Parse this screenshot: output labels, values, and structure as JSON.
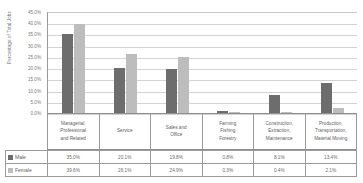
{
  "chart_data": {
    "type": "bar",
    "title": "",
    "xlabel": "",
    "ylabel": "Percentage of Total Jobs",
    "ylim": [
      0,
      45
    ],
    "grid": true,
    "legend_position": "bottom-table",
    "categories": [
      "Managerial, Professional and Related",
      "Service",
      "Sales and Office",
      "Farming Fishing Forestry",
      "Construction, Extraction, Maintenance",
      "Production, Transportation, Material Moving"
    ],
    "category_lines": [
      [
        "Managerial,",
        "Professional",
        "and Related"
      ],
      [
        "Service"
      ],
      [
        "Sales and",
        "Office"
      ],
      [
        "Farming",
        "Fishing",
        "Forestry"
      ],
      [
        "Construction,",
        "Extraction,",
        "Maintenance"
      ],
      [
        "Production,",
        "Transportation,",
        "Material Moving"
      ]
    ],
    "series": [
      {
        "name": "Male",
        "color": "#6d6d6d",
        "values": [
          35.0,
          20.1,
          19.8,
          0.8,
          8.1,
          13.4
        ],
        "labels": [
          "35.0%",
          "20.1%",
          "19.8%",
          "0.8%",
          "8.1%",
          "13.4%"
        ]
      },
      {
        "name": "Female",
        "color": "#bdbdbd",
        "values": [
          39.6,
          26.1,
          24.9,
          0.3,
          0.4,
          2.1
        ],
        "labels": [
          "39.6%",
          "26.1%",
          "24.9%",
          "0.3%",
          "0.4%",
          "2.1%"
        ]
      }
    ],
    "y_ticks": [
      45,
      40,
      35,
      30,
      25,
      20,
      15,
      10,
      5,
      0
    ],
    "y_tick_labels": [
      "45.0%",
      "40.0%",
      "35.0%",
      "30.0%",
      "25.0%",
      "20.0%",
      "15.0%",
      "10.0%",
      "5.0%",
      "0.0%"
    ]
  }
}
